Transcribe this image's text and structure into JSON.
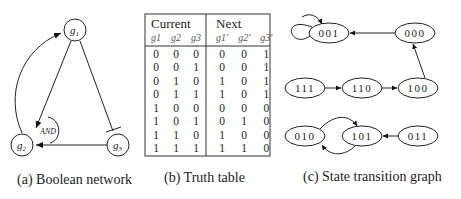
{
  "network": {
    "nodes": [
      {
        "id": "g1",
        "label": "g1"
      },
      {
        "id": "g2",
        "label": "g2"
      },
      {
        "id": "g3",
        "label": "g3"
      }
    ],
    "and_label": "AND",
    "caption": "(a) Boolean network"
  },
  "truth_table": {
    "group_current": "Current",
    "group_next": "Next",
    "headers": [
      "g1",
      "g2",
      "g3",
      "g1'",
      "g2'",
      "g3'"
    ],
    "rows": [
      [
        "0",
        "0",
        "0",
        "0",
        "0",
        "1"
      ],
      [
        "0",
        "0",
        "1",
        "0",
        "0",
        "1"
      ],
      [
        "0",
        "1",
        "0",
        "1",
        "0",
        "1"
      ],
      [
        "0",
        "1",
        "1",
        "1",
        "0",
        "1"
      ],
      [
        "1",
        "0",
        "0",
        "0",
        "0",
        "0"
      ],
      [
        "1",
        "0",
        "1",
        "0",
        "1",
        "0"
      ],
      [
        "1",
        "1",
        "0",
        "1",
        "0",
        "0"
      ],
      [
        "1",
        "1",
        "1",
        "1",
        "1",
        "0"
      ]
    ],
    "caption": "(b) Truth table"
  },
  "state_graph": {
    "states": [
      "001",
      "000",
      "111",
      "110",
      "100",
      "010",
      "101",
      "011"
    ],
    "caption": "(c) State transition graph"
  }
}
